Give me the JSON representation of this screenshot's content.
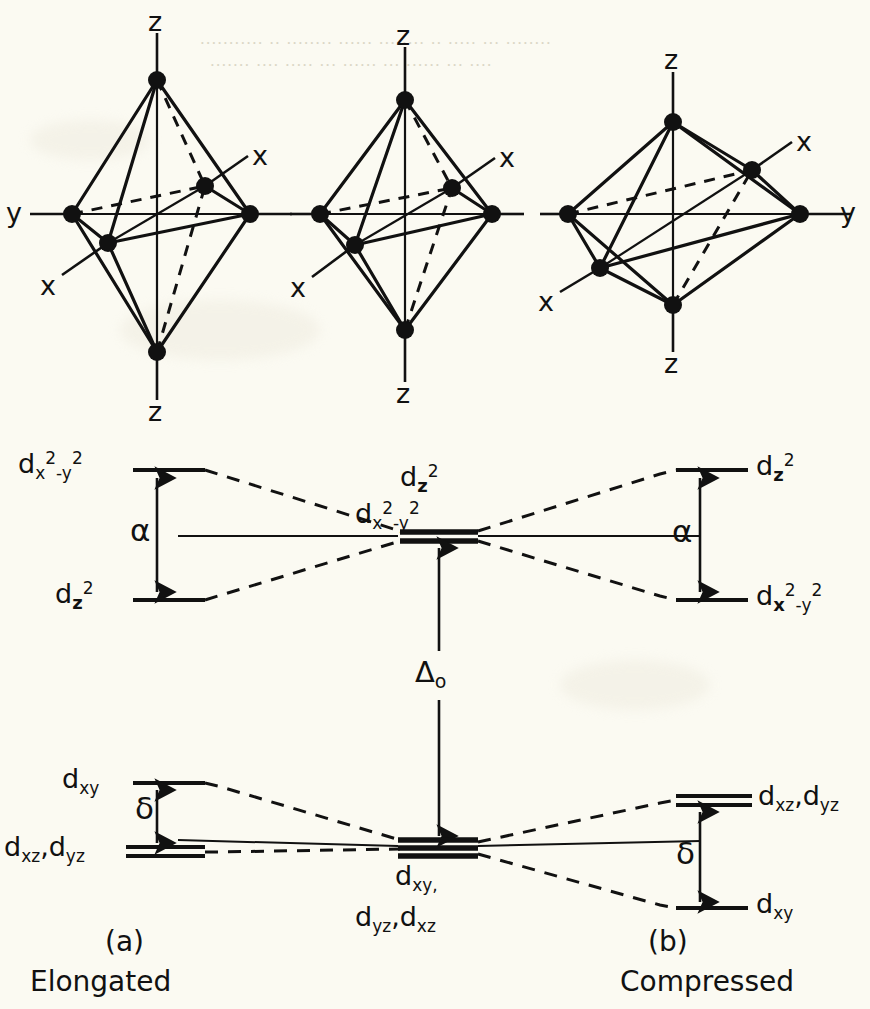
{
  "figure": {
    "type": "d-orbital-splitting-diagram"
  },
  "background_color": "#fbfaf2",
  "ink_color": "#111111",
  "structures": [
    {
      "id": "elongated",
      "shape": "elongated-octahedron",
      "axis_labels": {
        "top": "z",
        "bottom": "z",
        "left": "y",
        "upper_right": "x",
        "lower_left": "x"
      }
    },
    {
      "id": "regular",
      "shape": "regular-octahedron",
      "axis_labels": {
        "top": "z",
        "bottom": "z",
        "upper_right": "x",
        "lower_left": "x"
      }
    },
    {
      "id": "compressed",
      "shape": "compressed-octahedron",
      "axis_labels": {
        "top": "z",
        "bottom": "z",
        "right": "y",
        "upper_right": "x",
        "lower_left": "x"
      }
    }
  ],
  "energy_diagram": {
    "center": {
      "eg_labels": [
        "d_z2",
        "d_x2-y2"
      ],
      "eg_label_1_parts": {
        "base": "d",
        "sub": "z",
        "sup": "2"
      },
      "eg_label_2_parts": {
        "base": "d",
        "sub": "x",
        "sup1": "2",
        "sub2": "-y",
        "sup2": "2"
      },
      "t2g_label_line1": "d_xy,",
      "t2g_label_line2": "d_yz, d_xz",
      "splitting_label": "Δ",
      "splitting_sub": "o"
    },
    "left_panel": {
      "caption_letter": "(a)",
      "caption_name": "Elongated",
      "upper_gap_symbol": "α",
      "lower_gap_symbol": "δ",
      "levels": [
        {
          "name": "d_x2-y2",
          "group": "eg",
          "position": "upper"
        },
        {
          "name": "d_z2",
          "group": "eg",
          "position": "lower"
        },
        {
          "name": "d_xy",
          "group": "t2g",
          "position": "upper"
        },
        {
          "name": "d_xz, d_yz",
          "group": "t2g",
          "position": "lower",
          "degeneracy": 2
        }
      ]
    },
    "right_panel": {
      "caption_letter": "(b)",
      "caption_name": "Compressed",
      "upper_gap_symbol": "α",
      "lower_gap_symbol": "δ",
      "levels": [
        {
          "name": "d_z2",
          "group": "eg",
          "position": "upper"
        },
        {
          "name": "d_x2-y2",
          "group": "eg",
          "position": "lower"
        },
        {
          "name": "d_xz, d_yz",
          "group": "t2g",
          "position": "upper",
          "degeneracy": 2
        },
        {
          "name": "d_xy",
          "group": "t2g",
          "position": "lower"
        }
      ]
    }
  },
  "labels": {
    "z": "z",
    "y": "y",
    "x": "x",
    "alpha": "α",
    "delta": "δ",
    "delta_big": "Δ",
    "o_sub": "o",
    "cap_a": "(a)",
    "cap_b": "(b)",
    "elongated": "Elongated",
    "compressed": "Compressed",
    "d": "d",
    "xy": "xy",
    "xy_comma": "xy,",
    "xz_yz": "xz",
    "yz": "yz",
    "two": "2",
    "z_sub": "z",
    "x_sub": "x",
    "minus_y": "-y",
    "dxz_dyz": "d",
    "comma": ","
  }
}
